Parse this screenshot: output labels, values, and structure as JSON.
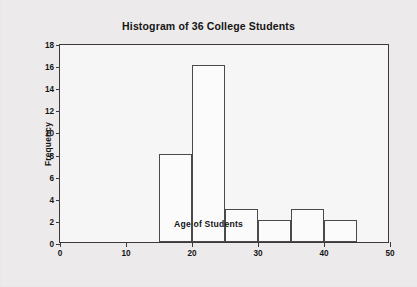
{
  "chart_data": {
    "type": "bar",
    "title": "Histogram of 36 College Students",
    "xlabel": "Age of Students",
    "ylabel": "Frequency",
    "xlim": [
      0,
      50
    ],
    "ylim": [
      0,
      18
    ],
    "xticks": [
      0,
      10,
      20,
      30,
      40,
      50
    ],
    "xtick_labels": [
      "0",
      "10",
      "20",
      "30",
      "40",
      "50"
    ],
    "yticks": [
      0,
      2,
      4,
      6,
      8,
      10,
      12,
      14,
      16,
      18
    ],
    "ytick_labels": [
      "0",
      "2",
      "4",
      "6",
      "8",
      "10",
      "12",
      "14",
      "16",
      "18"
    ],
    "grid": false,
    "legend": "none",
    "bin_width": 5,
    "bins": [
      {
        "label": "15-20",
        "start": 15,
        "end": 20,
        "value": 8
      },
      {
        "label": "20-25",
        "start": 20,
        "end": 25,
        "value": 16
      },
      {
        "label": "25-30",
        "start": 25,
        "end": 30,
        "value": 3
      },
      {
        "label": "30-35",
        "start": 30,
        "end": 35,
        "value": 2
      },
      {
        "label": "35-40",
        "start": 35,
        "end": 40,
        "value": 3
      },
      {
        "label": "40-45",
        "start": 40,
        "end": 45,
        "value": 2
      }
    ],
    "categories": [
      "15-20",
      "20-25",
      "25-30",
      "30-35",
      "35-40",
      "40-45"
    ],
    "values": [
      8,
      16,
      3,
      2,
      3,
      2
    ],
    "colors": {
      "bar_fill": "#fbfbfb",
      "bar_edge": "#4a4a4a",
      "axis": "#3a3a3a",
      "text": "#151515",
      "figure_background": "#eceaea",
      "plot_background": "#f7f6f6"
    }
  }
}
